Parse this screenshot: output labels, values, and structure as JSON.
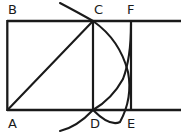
{
  "figure": {
    "background_color": "#ffffff",
    "stroke_color": "#1a1a1a",
    "label_color": "#1a1a1a",
    "stroke_width": 2.1,
    "canvas": {
      "width": 188,
      "height": 136
    }
  },
  "points": {
    "A": {
      "x": 7,
      "y": 110
    },
    "B": {
      "x": 7,
      "y": 21
    },
    "C": {
      "x": 93,
      "y": 21
    },
    "D": {
      "x": 93,
      "y": 110
    },
    "E": {
      "x": 131,
      "y": 110
    },
    "F": {
      "x": 131,
      "y": 21
    }
  },
  "labels": [
    {
      "id": "label-b",
      "text": "B",
      "x": 8,
      "y": 3
    },
    {
      "id": "label-c",
      "text": "C",
      "x": 94,
      "y": 3
    },
    {
      "id": "label-f",
      "text": "F",
      "x": 127,
      "y": 3
    },
    {
      "id": "label-a",
      "text": "A",
      "x": 8,
      "y": 117
    },
    {
      "id": "label-d",
      "text": "D",
      "x": 90,
      "y": 117
    },
    {
      "id": "label-e",
      "text": "E",
      "x": 127,
      "y": 117
    }
  ],
  "segments": [
    {
      "id": "top-edge",
      "name": "line-B-to-right-edge",
      "x1": 7,
      "y1": 21,
      "x2": 181,
      "y2": 21
    },
    {
      "id": "bottom-edge",
      "name": "line-A-to-right-edge",
      "x1": 7,
      "y1": 110,
      "x2": 181,
      "y2": 110
    },
    {
      "id": "left-edge",
      "name": "segment-BA",
      "x1": 7,
      "y1": 21,
      "x2": 7,
      "y2": 110
    },
    {
      "id": "segment-cd",
      "name": "segment-CD",
      "x1": 93,
      "y1": 21,
      "x2": 93,
      "y2": 110
    },
    {
      "id": "segment-fe",
      "name": "segment-FE",
      "x1": 131,
      "y1": 21,
      "x2": 131,
      "y2": 110
    },
    {
      "id": "diagonal-ac",
      "name": "diagonal-AC",
      "x1": 7,
      "y1": 110,
      "x2": 93,
      "y2": 21
    }
  ],
  "arcs": [
    {
      "id": "arc-c-d",
      "name": "arc-centered-at-A-through-C-and-D",
      "path": "M 60 3 Q 79 13 93 21 Q 120 40 128 72 Q 133 98 120 122 Q 110 127 93 110 Q 77 127 60 131",
      "description": "Long arc passing through C, bulging right past the CD segment, and continuing through D down to the lower left"
    },
    {
      "id": "arc-d-f",
      "name": "arc-from-D-to-F",
      "path": "M 93 110 Q 112 99 123 79 Q 131 58 131 24",
      "description": "Arc rising from D up to F, crossing the first arc near (126,73)"
    }
  ]
}
